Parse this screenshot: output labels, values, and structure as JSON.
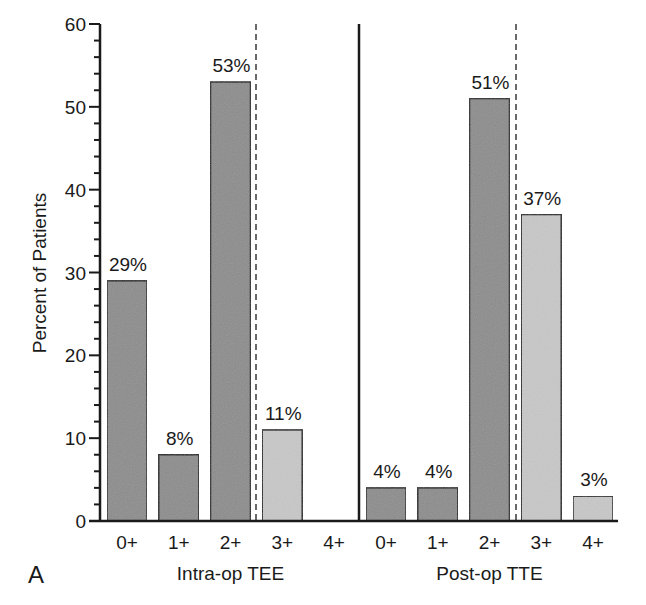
{
  "chart_data": {
    "type": "bar",
    "panel_label": "A",
    "ylabel": "Percent of Patients",
    "xlabel": "",
    "ylim": [
      0,
      60
    ],
    "yticks": [
      0,
      10,
      20,
      30,
      40,
      50,
      60
    ],
    "grid": false,
    "legend": null,
    "groups": [
      {
        "name": "Intra-op TEE",
        "categories": [
          "0+",
          "1+",
          "2+",
          "3+",
          "4+"
        ],
        "values": [
          29,
          8,
          53,
          11,
          0
        ],
        "labels": [
          "29%",
          "8%",
          "53%",
          "11%",
          ""
        ],
        "shades": [
          "dark",
          "dark",
          "dark",
          "light",
          "light"
        ]
      },
      {
        "name": "Post-op TTE",
        "categories": [
          "0+",
          "1+",
          "2+",
          "3+",
          "4+"
        ],
        "values": [
          4,
          4,
          51,
          37,
          3
        ],
        "labels": [
          "4%",
          "4%",
          "51%",
          "37%",
          "3%"
        ],
        "shades": [
          "dark",
          "dark",
          "dark",
          "light",
          "light"
        ]
      }
    ],
    "annotations": [
      "Dashed vertical line separates grades 0+–2+ from 3+–4+ in each group",
      "Solid vertical line separates Intra-op TEE and Post-op TTE groups"
    ],
    "colors": {
      "dark": "#8c8c8c",
      "light": "#c8c8c8",
      "edge": "#1a1a1a"
    }
  }
}
